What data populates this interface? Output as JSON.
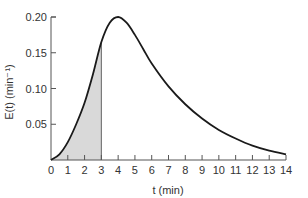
{
  "chart_data": {
    "type": "line",
    "title": "",
    "xlabel": "t (min)",
    "ylabel": "E(t)  (min⁻¹)",
    "xlim": [
      0,
      14
    ],
    "ylim": [
      0,
      0.2
    ],
    "grid": false,
    "legend": null,
    "x_ticks": [
      "0",
      "1",
      "2",
      "3",
      "4",
      "5",
      "6",
      "7",
      "8",
      "9",
      "10",
      "11",
      "12",
      "13",
      "14"
    ],
    "y_ticks": [
      "0.05",
      "0.10",
      "0.15",
      "0.20"
    ],
    "series": [
      {
        "name": "E(t)",
        "x": [
          0,
          0.5,
          1,
          1.5,
          2,
          2.5,
          3,
          3.5,
          4,
          4.5,
          5,
          5.5,
          6,
          7,
          8,
          9,
          10,
          11,
          12,
          13,
          14
        ],
        "y": [
          0,
          0.008,
          0.025,
          0.05,
          0.08,
          0.12,
          0.165,
          0.192,
          0.2,
          0.192,
          0.175,
          0.155,
          0.135,
          0.103,
          0.078,
          0.058,
          0.042,
          0.03,
          0.02,
          0.013,
          0.008
        ]
      }
    ],
    "annotations": [
      {
        "type": "shaded_area",
        "from_x": 0,
        "to_x": 3,
        "under": "E(t)",
        "color": "#d9d9d9"
      }
    ]
  },
  "colors": {
    "curve": "#1a1a1a",
    "axis": "#555555",
    "shade": "#d9d9d9",
    "text": "#333333"
  }
}
